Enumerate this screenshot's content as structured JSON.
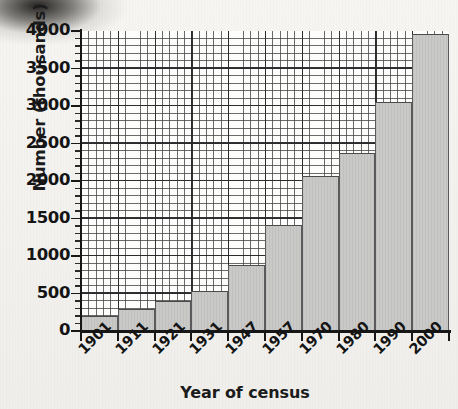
{
  "chart_data": {
    "type": "bar",
    "title": "",
    "xlabel": "Year of census",
    "ylabel": "Number (thousands)",
    "categories": [
      "1901",
      "1911",
      "1921",
      "1931",
      "1947",
      "1957",
      "1970",
      "1980",
      "1990",
      "2000"
    ],
    "values": [
      200,
      290,
      400,
      540,
      880,
      1420,
      2070,
      2380,
      3050,
      3960
    ],
    "ylim": [
      0,
      4000
    ],
    "y_ticks": [
      "0",
      "500",
      "1000",
      "1500",
      "2000",
      "2500",
      "3000",
      "3500",
      "4000"
    ],
    "y_tick_values": [
      0,
      500,
      1000,
      1500,
      2000,
      2500,
      3000,
      3500,
      4000
    ],
    "y_minor_step": 50,
    "grid": true,
    "legend": "none",
    "bar_color": "#c9c9c7",
    "bar_edge_color": "#4a4a4c",
    "grid_color": "#464648",
    "axis_color": "#171717",
    "background": "#fdfdfc"
  },
  "page": {
    "paper_color": "#f3f2ef",
    "corner_smudge": "scan-artifact"
  }
}
